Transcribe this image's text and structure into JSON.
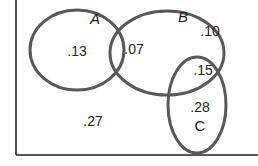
{
  "diagram": {
    "type": "venn",
    "sets": [
      {
        "name": "A",
        "label": "A"
      },
      {
        "name": "B",
        "label": "B"
      },
      {
        "name": "C",
        "label": "C"
      }
    ],
    "regions": {
      "a_only": ".13",
      "a_and_b": ".07",
      "b_only": ".10",
      "b_and_c": ".15",
      "c_only": ".28",
      "outside": ".27"
    },
    "colors": {
      "ellipse_stroke": "#585858",
      "frame": "#1e1e1e",
      "text": "#222222",
      "background": "#ffffff"
    }
  }
}
